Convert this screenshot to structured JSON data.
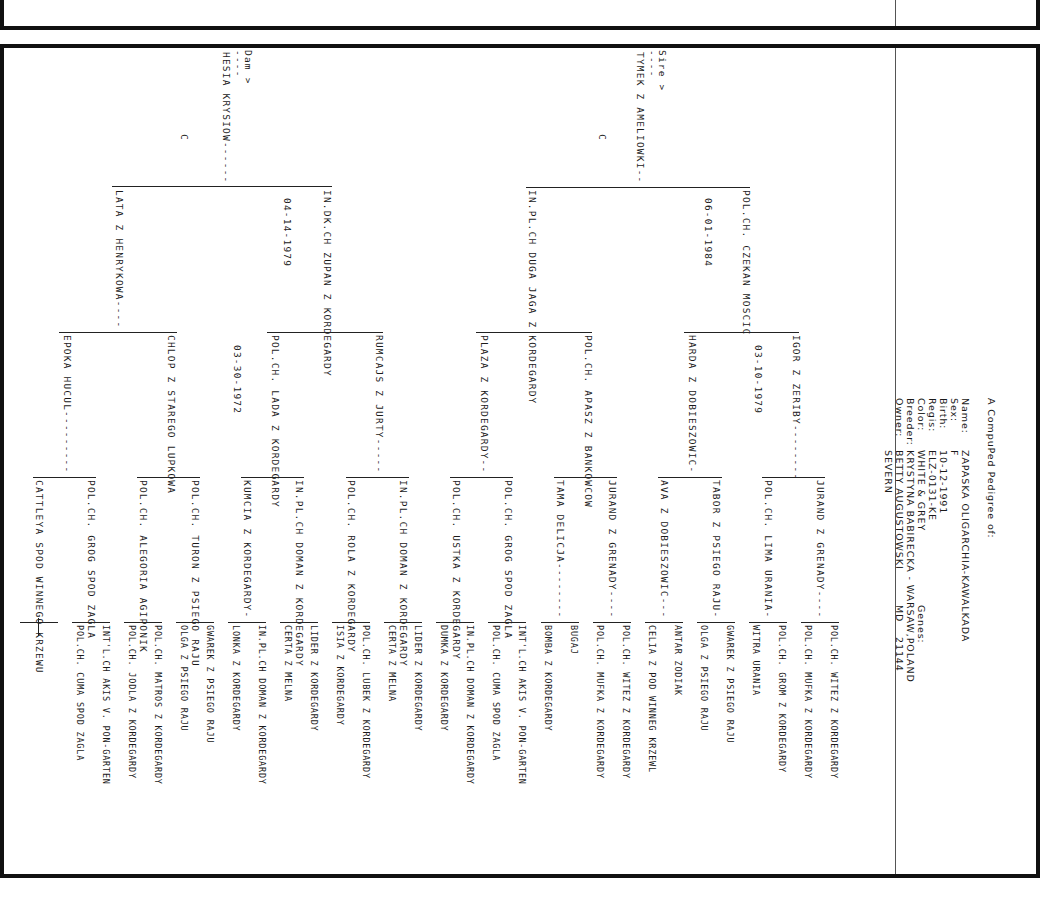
{
  "header": {
    "title": "A CompuPed Pedigree of:",
    "labels": [
      "Name:",
      "Sex:",
      "Birth:",
      "Regis:",
      "Color:",
      "Breeder:",
      "Owner:"
    ],
    "name": "ZAPASKA OLIGARCHIA-KAWALKADA",
    "sex": "F",
    "birth": "10-12-1991",
    "regis": "ELZ-0131-KE",
    "color": "WHITE & GREY",
    "breeder": "KRYSTYNA BABIRECKA  -  WARSAW,POLAND",
    "owner": "BETTY AUGUSTOWSKI",
    "owner_line2": "SEVERN",
    "state": "MD",
    "zip": "21144",
    "genes_label": "Genes:"
  },
  "pedigree": {
    "sire_label": "Sire >",
    "dam_label": "Dam >",
    "dashes": "----",
    "sire": {
      "name": "TYMEK Z AMELIOWKI--",
      "color_code": "C"
    },
    "dam": {
      "name": "HESIA KRYSIOW------",
      "color_code": "C"
    },
    "gen2": [
      {
        "name": "POL.CH. CZEKAN MOSCIC",
        "date": "06-01-1984"
      },
      {
        "name": "IN.PL.CH DUGA JAGA Z KORDEGARDY",
        "date": ""
      },
      {
        "name": "IN.DK.CH ZUPAN Z KORDEGARDY",
        "date": "04-14-1979"
      },
      {
        "name": "LATA Z HENRYKOWA----",
        "date": ""
      }
    ],
    "gen3": [
      {
        "name": "IGOR Z ZERIBY--------",
        "date": "03-10-1979"
      },
      {
        "name": "HARDA Z DOBIESZOWIC-",
        "date": ""
      },
      {
        "name": "POL.CH. APASZ Z BANKOWCOW",
        "date": ""
      },
      {
        "name": "PLAZA Z KORDEGARDY--",
        "date": ""
      },
      {
        "name": "RUMCAJS Z JURTY-----",
        "date": ""
      },
      {
        "name": "POL.CH. LADA Z KORDEGARDY",
        "date": "03-30-1972"
      },
      {
        "name": "CHLOP Z STAREGO LUPKOWA",
        "date": ""
      },
      {
        "name": "EPOKA HUCUL---------",
        "date": ""
      }
    ],
    "gen4": [
      "JURAND Z GRENADY----",
      "POL.CH. LIMA URANIA-",
      "TABOR Z PSIEGO RAJU-",
      "AVA Z DOBIESZOWIC---",
      "JURAND Z GRENADY----",
      "TAMA DELICJA--------",
      "POL.CH. GROG SPOD ZAGLA",
      "POL.CH. USTKA Z KORDEGARDY",
      "IN.PL.CH DOMAN Z KORDEGARDY",
      "POL.CH. ROLA Z KORDEGARDY",
      "IN.PL.CH DOMAN Z KORDEGARDY",
      "KUMCIA Z KORDEGARDY-",
      "POL.CH. TURON Z PSIEGO RAJU",
      "POL.CH. ALEGORIA AGIPONIK",
      "POL.CH. GROG SPOD ZAGLA",
      "CATTLEYA SPOD WINNEGO KRZEWU"
    ],
    "gen5": [
      "POL.CH. WITEZ Z KORDEGARDY",
      "POL.CH. MUFKA Z KORDEGARDY",
      "POL.CH. GROM Z KORDEGARDY",
      "WITRA URANIA",
      "GWAREK Z PSIEGO RAJU",
      "OLGA Z PSIEGO RAJU",
      "ANTAR ZODIAK",
      "CELIA Z POD WINNEG KRZEWL",
      "POL.CH. WITEZ Z KORDEGARDY",
      "POL.CH. MUFKA Z KORDEGARDY",
      "BUGAJ",
      "BOMBA Z KORDEGARDY",
      "INT'L.CH AKIS V. PON-GARTEN",
      "POL.CH. CUMA SPOD ZAGLA",
      "IN.PL.CH DOMAN Z KORDEGARDY",
      "DUMKA Z KORDEGARDY",
      "LIDER Z KORDEGARDY",
      "CERTA Z MELNA",
      "POL.CH. LUBEK Z KORDEGARDY",
      "ISIA Z KORDEGARDY",
      "LIDER Z KORDEGARDY",
      "CERTA Z MELNA",
      "IN.PL.CH DOMAN Z KORDEGARDY",
      "LONKA Z KORDEGARDY",
      "GWAREK Z PSIEGO RAJU",
      "OLGA Z PSIEGO RAJU",
      "POL.CH. MATROS Z KORDEGARDY",
      "POL.CH. JODLA Z KORDEGARDY",
      "INT'L.CH AKIS V. PON-GARTEN",
      "POL.CH. CUMA SPOD ZAGLA",
      "",
      ""
    ]
  }
}
